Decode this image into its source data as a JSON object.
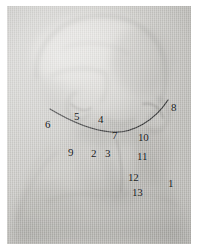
{
  "figure": {
    "kind": "anatomical-illustration-photograph",
    "medium_tone": "grey photographic halftone on woven paper",
    "colors": {
      "paper_light": "#cfcecb",
      "paper_mid": "#c4c3bf",
      "paper_dark": "#b2b1ad",
      "shadow": "#9a9995",
      "ink_line": "#1b1c1e",
      "label_text": "#17181a",
      "page_margin": "#ffffff"
    },
    "plate": {
      "left": 7,
      "top": 6,
      "width": 184,
      "height": 238
    }
  },
  "overlay_line": {
    "name": "mandible-border-curve",
    "description": "dark hand-drawn arc tracing the lower border of the mandible from the left temple region to the right mastoid region",
    "color": "#17181a",
    "stroke_width": 1.2,
    "path": "M 43 103 C 58 112, 80 124, 104 126 C 126 128, 148 114, 161 94"
  },
  "labels": [
    {
      "id": "label-1",
      "text": "1",
      "x": 161,
      "y": 172
    },
    {
      "id": "label-2",
      "text": "2",
      "x": 84,
      "y": 142
    },
    {
      "id": "label-3",
      "text": "3",
      "x": 98,
      "y": 142
    },
    {
      "id": "label-4",
      "text": "4",
      "x": 91,
      "y": 108
    },
    {
      "id": "label-5",
      "text": "5",
      "x": 67,
      "y": 105
    },
    {
      "id": "label-6",
      "text": "6",
      "x": 38,
      "y": 113
    },
    {
      "id": "label-7",
      "text": "7",
      "x": 105,
      "y": 124
    },
    {
      "id": "label-8",
      "text": "8",
      "x": 164,
      "y": 96
    },
    {
      "id": "label-9",
      "text": "9",
      "x": 61,
      "y": 141
    },
    {
      "id": "label-10",
      "text": "10",
      "x": 131,
      "y": 126
    },
    {
      "id": "label-11",
      "text": "11",
      "x": 130,
      "y": 145
    },
    {
      "id": "label-12",
      "text": "12",
      "x": 121,
      "y": 166
    },
    {
      "id": "label-13",
      "text": "13",
      "x": 125,
      "y": 181
    }
  ]
}
